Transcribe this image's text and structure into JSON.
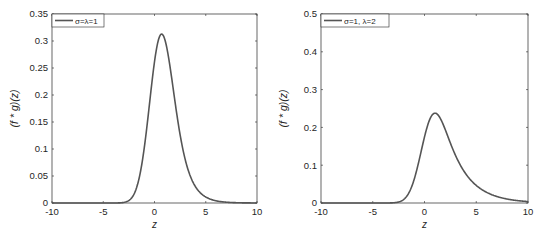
{
  "chart_data": [
    {
      "type": "line",
      "title": "",
      "xlabel": "z",
      "ylabel": "(f * g)(z)",
      "xlim": [
        -10,
        10
      ],
      "ylim": [
        0,
        0.35
      ],
      "xticks": [
        -10,
        -5,
        0,
        5,
        10
      ],
      "xtick_labels": [
        "-10",
        "-5",
        "0",
        "5",
        "10"
      ],
      "yticks": [
        0,
        0.05,
        0.1,
        0.15,
        0.2,
        0.25,
        0.3,
        0.35
      ],
      "ytick_labels": [
        "0",
        "0.05",
        "0.1",
        "0.15",
        "0.2",
        "0.25",
        "0.3",
        "0.35"
      ],
      "grid": false,
      "legend_position": "upper left",
      "params": {
        "sigma": 1,
        "lambda": 1
      },
      "series": [
        {
          "name": "σ=λ=1",
          "color": "#555555",
          "x": [
            -10,
            -5,
            -3,
            -2,
            -1,
            0,
            0.6,
            1,
            2,
            3,
            4,
            5,
            6,
            7,
            8,
            10
          ],
          "y": [
            0,
            0,
            0.002,
            0.015,
            0.068,
            0.1876,
            0.312,
            0.3,
            0.22,
            0.13,
            0.068,
            0.028,
            0.012,
            0.004,
            0.0015,
            0.0002
          ]
        }
      ]
    },
    {
      "type": "line",
      "title": "",
      "xlabel": "z",
      "ylabel": "(f * g)(z)",
      "xlim": [
        -10,
        10
      ],
      "ylim": [
        0,
        0.5
      ],
      "xticks": [
        -10,
        -5,
        0,
        5,
        10
      ],
      "xtick_labels": [
        "-10",
        "-5",
        "0",
        "5",
        "10"
      ],
      "yticks": [
        0,
        0.1,
        0.2,
        0.3,
        0.4,
        0.5
      ],
      "ytick_labels": [
        "0",
        "0.1",
        "0.2",
        "0.3",
        "0.4",
        "0.5"
      ],
      "grid": false,
      "legend_position": "upper left",
      "params": {
        "sigma": 1,
        "lambda": 0.5
      },
      "series": [
        {
          "name": "σ=1, λ=2",
          "color": "#555555",
          "x": [
            -10,
            -5,
            -3,
            -2,
            -1,
            0,
            1.2,
            2,
            3,
            4,
            5,
            6,
            7,
            8,
            10
          ],
          "y": [
            0,
            0,
            0.003,
            0.02,
            0.09,
            0.26,
            0.428,
            0.38,
            0.28,
            0.19,
            0.12,
            0.075,
            0.045,
            0.027,
            0.009
          ]
        }
      ]
    }
  ]
}
